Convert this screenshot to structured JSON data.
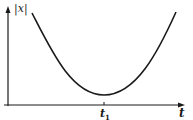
{
  "diagram": {
    "type": "function-plot",
    "y_axis_label": "|x|",
    "x_axis_label": "t",
    "x_tick_label": "t",
    "x_tick_subscript": "1",
    "curve": "parabola-like with minimum at t1 above the t-axis",
    "colors": {
      "stroke": "#1a1a1a",
      "background": "#ffffff"
    }
  }
}
